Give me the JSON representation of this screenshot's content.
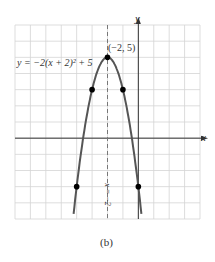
{
  "chart_data": {
    "type": "line",
    "title": "",
    "caption": "(b)",
    "equation_label": "y = −2(x + 2)² + 5",
    "xlabel": "x",
    "ylabel": "y",
    "xlim": [
      -8,
      4
    ],
    "ylim": [
      -5,
      7
    ],
    "grid": true,
    "vertex": {
      "x": -2,
      "y": 5,
      "label": "(−2, 5)"
    },
    "axis_of_symmetry": {
      "x": -2,
      "label": "x = −2",
      "style": "dashed"
    },
    "series": [
      {
        "name": "y = -2(x+2)^2 + 5",
        "points": [
          {
            "x": -3,
            "y": 3
          },
          {
            "x": -2,
            "y": 5
          },
          {
            "x": -1,
            "y": 3
          },
          {
            "x": -4,
            "y": -3
          },
          {
            "x": 0,
            "y": -3
          }
        ]
      }
    ]
  },
  "labels": {
    "equation": "y = −2(x + 2)² + 5",
    "vertex": "(−2, 5)",
    "x_axis": "x",
    "y_axis": "y",
    "symmetry": "x = −2",
    "caption": "(b)"
  }
}
